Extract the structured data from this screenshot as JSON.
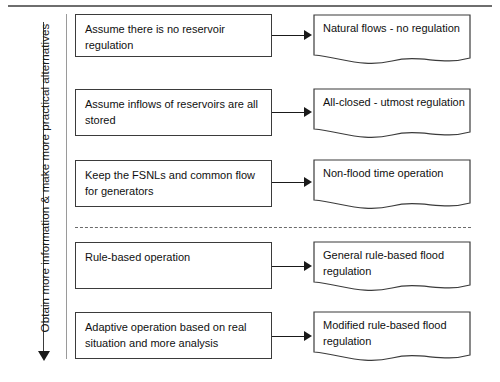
{
  "diagram": {
    "axis_caption": "Obtain more information & make more practical alternatives",
    "rows": [
      {
        "id": "row-1",
        "scenario": "Assume there is no reservoir regulation",
        "outcome": "Natural flows - no regulation"
      },
      {
        "id": "row-2",
        "scenario": "Assume inflows of reservoirs are all stored",
        "outcome": "All-closed - utmost regulation"
      },
      {
        "id": "row-3",
        "scenario": "Keep the FSNLs and common flow for generators",
        "outcome": "Non-flood time operation"
      },
      {
        "id": "row-4",
        "scenario": "Rule-based operation",
        "outcome": "General rule-based flood regulation"
      },
      {
        "id": "row-5",
        "scenario": "Adaptive operation based on real situation and more analysis",
        "outcome": "Modified rule-based flood regulation"
      }
    ],
    "colors": {
      "box_border": "#3b3b3b",
      "text": "#101010",
      "rule": "#6e6e6e",
      "divider": "#6b6b6b",
      "arrow": "#1a1a1a"
    }
  }
}
